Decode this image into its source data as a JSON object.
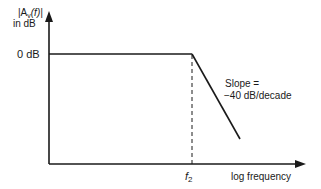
{
  "diagram": {
    "type": "bode-magnitude-asymptote",
    "y_axis_label_line1_prefix": "|A",
    "y_axis_label_sub": "v",
    "y_axis_label_line1_suffix": "(f)|",
    "y_axis_label_line2": "in  dB",
    "zero_db_label": "0  dB",
    "corner_label_main": "f",
    "corner_label_sub": "2",
    "x_axis_label": "log  frequency",
    "slope_label_line1": "Slope =",
    "slope_label_line2": "−40  dB/decade",
    "slope_db_per_decade": -40,
    "passband_gain_db": 0,
    "line_color": "#1a1a1a"
  }
}
